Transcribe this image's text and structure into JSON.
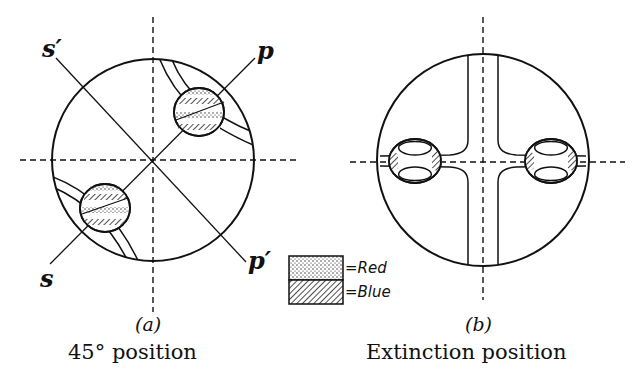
{
  "figure": {
    "panel_a": {
      "label": "(a)",
      "caption": "45° position",
      "axis_labels": {
        "s_prime": "s′",
        "p": "p",
        "s": "s",
        "p_prime": "p′"
      }
    },
    "panel_b": {
      "label": "(b)",
      "caption": "Extinction position"
    },
    "legend": {
      "items": [
        {
          "pattern": "stippled",
          "label": "=Red"
        },
        {
          "pattern": "hatched",
          "label": "=Blue"
        }
      ]
    }
  }
}
